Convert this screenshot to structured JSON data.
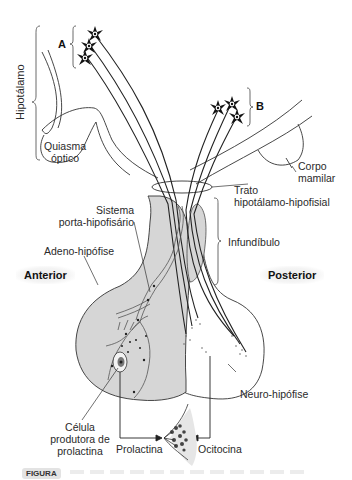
{
  "figure": {
    "regions": {
      "hypothalamus": "Hipotálamo",
      "optic_chiasm_line1": "Quiasma",
      "optic_chiasm_line2": "óptico",
      "mammillary_line1": "Corpo",
      "mammillary_line2": "mamilar",
      "tract_line1": "Trato",
      "tract_line2": "hipotálamo-hipofisial",
      "infundibulum": "Infundíbulo",
      "portal_line1": "Sistema",
      "portal_line2": "porta-hipofisário",
      "adenohypophysis": "Adeno-hipófise",
      "neurohypophysis": "Neuro-hipófise",
      "anterior": "Anterior",
      "posterior": "Posterior",
      "cell_line1": "Célula",
      "cell_line2": "produtora de",
      "cell_line3": "prolactina"
    },
    "neuron_groups": {
      "group_a": "A",
      "group_b": "B"
    },
    "hormones": {
      "prolactin": "Prolactina",
      "oxytocin": "Ocitocina"
    },
    "caption_tag": "FIGURA",
    "colors": {
      "gland_fill": "#d6d6d6",
      "line": "#2b2b2b",
      "label_bg": "#eeeeee"
    }
  }
}
